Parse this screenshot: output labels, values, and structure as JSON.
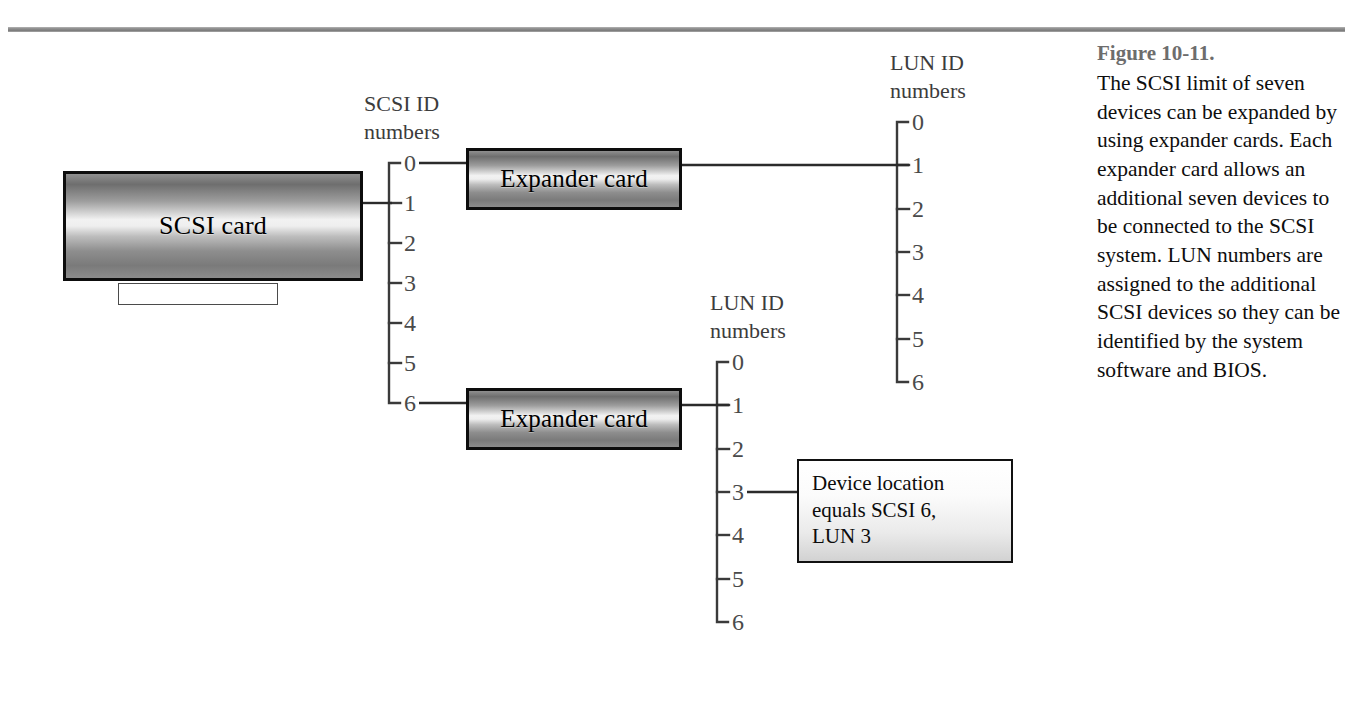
{
  "figure": {
    "number": "Figure 10-11.",
    "caption": "The SCSI limit of seven devices can be expanded by using expander cards. Each expander card allows an additional seven devices to be connected to the SCSI system. LUN numbers are assigned to the additional SCSI devices so they can be identified by the system software and BIOS."
  },
  "nodes": {
    "scsi_card": "SCSI card",
    "expander_card_top": "Expander card",
    "expander_card_bottom": "Expander card",
    "device_box_line1": "Device location",
    "device_box_line2": "equals SCSI 6,",
    "device_box_line3": "LUN 3"
  },
  "scales": {
    "scsi_id": {
      "title_line1": "SCSI ID",
      "title_line2": "numbers",
      "ticks": [
        "0",
        "1",
        "2",
        "3",
        "4",
        "5",
        "6"
      ],
      "connected_from_card": "1",
      "connects_out": [
        "0",
        "6"
      ]
    },
    "lun_id_top": {
      "title_line1": "LUN ID",
      "title_line2": "numbers",
      "ticks": [
        "0",
        "1",
        "2",
        "3",
        "4",
        "5",
        "6"
      ],
      "connected_at": "1"
    },
    "lun_id_bottom": {
      "title_line1": "LUN ID",
      "title_line2": "numbers",
      "ticks": [
        "0",
        "1",
        "2",
        "3",
        "4",
        "5",
        "6"
      ],
      "connected_at": "1",
      "device_at": "3"
    }
  },
  "colors": {
    "rule": "#8d8d8d",
    "scale_text": "#4a4a4a",
    "line": "#2b2b2b",
    "card_border": "#0d0d0d",
    "caption_fig_no": "#6d6d6d"
  }
}
